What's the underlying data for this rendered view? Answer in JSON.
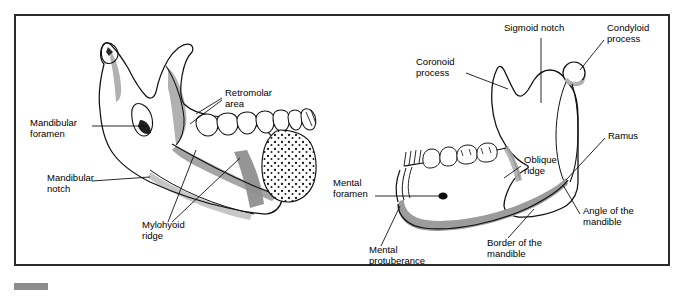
{
  "figure": {
    "type": "anatomical-line-drawing",
    "frame": {
      "border_color": "#2b2b2b",
      "background": "#ffffff"
    },
    "ink_color": "#000000",
    "shade_color": "#9a9a9a",
    "panels": [
      {
        "id": "left-panel",
        "name": "mandible-medial-view",
        "labels": [
          {
            "id": "retromolar-area",
            "text": "Retromolar\narea",
            "x": 225,
            "y": 93,
            "align": "left",
            "leaders": 2
          },
          {
            "id": "mandibular-foramen",
            "text": "Mandibular\nforamen",
            "x": 30,
            "y": 123,
            "align": "left",
            "leaders": 1
          },
          {
            "id": "mandibular-notch",
            "text": "Mandibular\nnotch",
            "x": 47,
            "y": 178,
            "align": "left",
            "leaders": 1
          },
          {
            "id": "mylohyoid-ridge",
            "text": "Mylohyoid\nridge",
            "x": 142,
            "y": 225,
            "align": "left",
            "leaders": 2
          }
        ]
      },
      {
        "id": "right-panel",
        "name": "mandible-lateral-view",
        "labels": [
          {
            "id": "sigmoid-notch",
            "text": "Sigmoid notch",
            "x": 504,
            "y": 28,
            "align": "left",
            "leaders": 1
          },
          {
            "id": "condyloid-process",
            "text": "Condyloid\nprocess",
            "x": 607,
            "y": 28,
            "align": "left",
            "leaders": 1
          },
          {
            "id": "coronoid-process",
            "text": "Coronoid\nprocess",
            "x": 416,
            "y": 62,
            "align": "left",
            "leaders": 1
          },
          {
            "id": "ramus",
            "text": "Ramus",
            "x": 608,
            "y": 136,
            "align": "left",
            "leaders": 1
          },
          {
            "id": "oblique-ridge",
            "text": "Oblique\nridge",
            "x": 524,
            "y": 160,
            "align": "left",
            "leaders": 1
          },
          {
            "id": "mental-foramen",
            "text": "Mental\nforamen",
            "x": 333,
            "y": 183,
            "align": "left",
            "leaders": 1
          },
          {
            "id": "angle-of-the-mandible",
            "text": "Angle of the\nmandible",
            "x": 583,
            "y": 211,
            "align": "left",
            "leaders": 1
          },
          {
            "id": "border-of-the-mandible",
            "text": "Border of the\nmandible",
            "x": 487,
            "y": 243,
            "align": "left",
            "leaders": 1
          },
          {
            "id": "mental-protuberance",
            "text": "Mental\nprotuberance",
            "x": 369,
            "y": 250,
            "align": "left",
            "leaders": 1
          }
        ]
      }
    ]
  }
}
